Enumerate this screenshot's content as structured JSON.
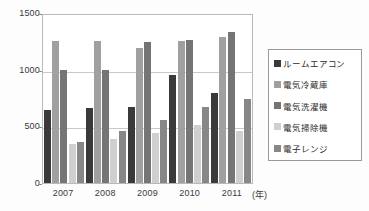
{
  "chart_data": {
    "type": "bar",
    "title": "",
    "xlabel": "年",
    "ylabel": "",
    "categories": [
      "2007",
      "2008",
      "2009",
      "2010",
      "2011"
    ],
    "ylim": [
      0,
      1500
    ],
    "yticks": [
      0,
      500,
      1000,
      1500
    ],
    "grid": true,
    "legend_position": "right",
    "series": [
      {
        "name": "ルームエアコン",
        "color": "#3a3a3a",
        "values": [
          640,
          665,
          670,
          955,
          790
        ]
      },
      {
        "name": "電気冷蔵庫",
        "color": "#a0a0a0",
        "values": [
          1250,
          1250,
          1190,
          1250,
          1290
        ]
      },
      {
        "name": "電気洗濯機",
        "color": "#757575",
        "values": [
          1000,
          1000,
          1240,
          1260,
          1335
        ]
      },
      {
        "name": "電気掃除機",
        "color": "#cfcfcf",
        "values": [
          340,
          390,
          440,
          515,
          460
        ]
      },
      {
        "name": "電子レンジ",
        "color": "#878787",
        "values": [
          360,
          455,
          560,
          670,
          745
        ]
      }
    ]
  },
  "axis": {
    "y_tick_labels": [
      "1500",
      "1000",
      "500",
      "0"
    ],
    "x_tick_labels": [
      "2007",
      "2008",
      "2009",
      "2010",
      "2011"
    ],
    "x_unit_label": "(年)"
  },
  "legend": {
    "items": [
      {
        "label": "ルームエアコン",
        "color": "#3a3a3a"
      },
      {
        "label": "電気冷蔵庫",
        "color": "#a0a0a0"
      },
      {
        "label": "電気洗濯機",
        "color": "#757575"
      },
      {
        "label": "電気掃除機",
        "color": "#cfcfcf"
      },
      {
        "label": "電子レンジ",
        "color": "#878787"
      }
    ]
  }
}
